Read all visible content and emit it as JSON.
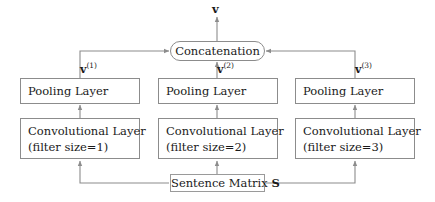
{
  "figure": {
    "kind": "cnn-architecture-diagram",
    "background_color": "#ffffff",
    "line_color": "#8c8c8c",
    "text_color": "#1a1a1a"
  },
  "output": {
    "label": "v",
    "description": "final concatenated sentence vector"
  },
  "concatenation": {
    "label": "Concatenation"
  },
  "input": {
    "label_text": "Sentence Matrix ",
    "label_symbol": "S"
  },
  "branches": [
    {
      "id": "branch-1",
      "vector_label": "v",
      "vector_superscript": "(1)",
      "pooling_label": "Pooling Layer",
      "conv_line1": "Convolutional Layer",
      "conv_line2": "(filter size=1)",
      "filter_size": 1
    },
    {
      "id": "branch-2",
      "vector_label": "v",
      "vector_superscript": "(2)",
      "pooling_label": "Pooling Layer",
      "conv_line1": "Convolutional Layer",
      "conv_line2": "(filter size=2)",
      "filter_size": 2
    },
    {
      "id": "branch-3",
      "vector_label": "v",
      "vector_superscript": "(3)",
      "pooling_label": "Pooling Layer",
      "conv_line1": "Convolutional Layer",
      "conv_line2": "(filter size=3)",
      "filter_size": 3
    }
  ]
}
